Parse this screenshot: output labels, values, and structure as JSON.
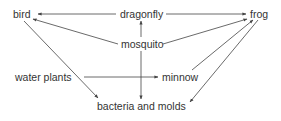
{
  "diagram": {
    "type": "food-web",
    "line_color": "#444444",
    "nodes": [
      {
        "id": "bird",
        "label": "bird",
        "x": 13,
        "y": 8
      },
      {
        "id": "dragonfly",
        "label": "dragonfly",
        "x": 120,
        "y": 8
      },
      {
        "id": "frog",
        "label": "frog",
        "x": 250,
        "y": 8
      },
      {
        "id": "mosquito",
        "label": "mosquito",
        "x": 121,
        "y": 38
      },
      {
        "id": "water_plants",
        "label": "water plants",
        "x": 15,
        "y": 71
      },
      {
        "id": "minnow",
        "label": "minnow",
        "x": 162,
        "y": 71
      },
      {
        "id": "bacteria_and_molds",
        "label": "bacteria and molds",
        "x": 97,
        "y": 100
      }
    ],
    "edges": [
      {
        "from": "dragonfly",
        "to": "bird"
      },
      {
        "from": "dragonfly",
        "to": "frog"
      },
      {
        "from": "mosquito",
        "to": "dragonfly"
      },
      {
        "from": "mosquito",
        "to": "bird"
      },
      {
        "from": "mosquito",
        "to": "frog"
      },
      {
        "from": "mosquito",
        "to": "bacteria_and_molds"
      },
      {
        "from": "water_plants",
        "to": "minnow"
      },
      {
        "from": "bird",
        "to": "bacteria_and_molds"
      },
      {
        "from": "minnow",
        "to": "frog"
      },
      {
        "from": "frog",
        "to": "bacteria_and_molds"
      }
    ]
  }
}
